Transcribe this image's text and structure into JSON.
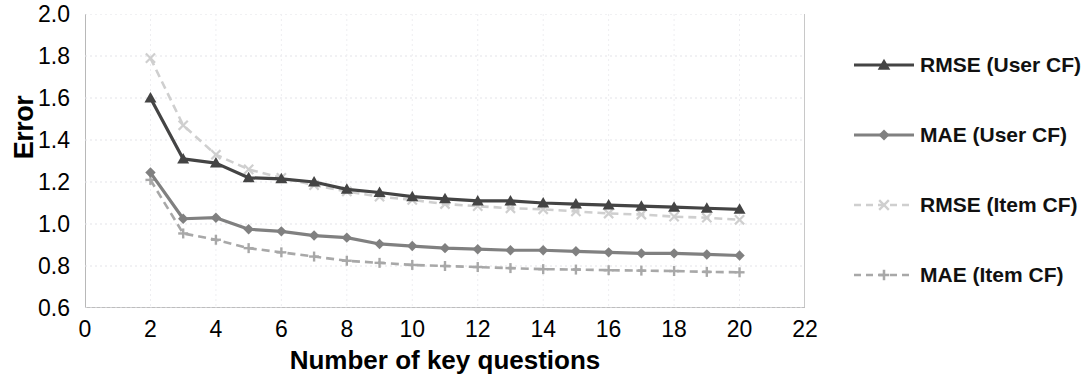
{
  "chart_data": {
    "type": "line",
    "title": "",
    "xlabel": "Number of key questions",
    "ylabel": "Error",
    "xlim": [
      0,
      22
    ],
    "ylim": [
      0.6,
      2.0
    ],
    "xticks": [
      "0",
      "2",
      "4",
      "6",
      "8",
      "10",
      "12",
      "14",
      "16",
      "18",
      "20",
      "22"
    ],
    "yticks": [
      "2.0",
      "1.8",
      "1.6",
      "1.4",
      "1.2",
      "1.0",
      "0.8",
      "0.6"
    ],
    "grid": true,
    "legend_position": "right",
    "x": [
      2,
      3,
      4,
      5,
      6,
      7,
      8,
      9,
      10,
      11,
      12,
      13,
      14,
      15,
      16,
      17,
      18,
      19,
      20
    ],
    "series": [
      {
        "name": "RMSE (User CF)",
        "color": "#444444",
        "style": "solid",
        "marker": "triangle",
        "values": [
          1.6,
          1.31,
          1.29,
          1.22,
          1.215,
          1.2,
          1.165,
          1.15,
          1.13,
          1.12,
          1.11,
          1.11,
          1.1,
          1.095,
          1.09,
          1.085,
          1.08,
          1.075,
          1.07
        ]
      },
      {
        "name": "MAE (User CF)",
        "color": "#808080",
        "style": "solid",
        "marker": "diamond",
        "values": [
          1.245,
          1.025,
          1.03,
          0.975,
          0.965,
          0.945,
          0.935,
          0.905,
          0.895,
          0.885,
          0.88,
          0.875,
          0.875,
          0.87,
          0.865,
          0.86,
          0.86,
          0.855,
          0.85
        ]
      },
      {
        "name": "RMSE (Item CF)",
        "color": "#cfcfcf",
        "style": "dashed",
        "marker": "x",
        "values": [
          1.79,
          1.47,
          1.33,
          1.26,
          1.22,
          1.185,
          1.155,
          1.13,
          1.115,
          1.095,
          1.085,
          1.075,
          1.07,
          1.06,
          1.05,
          1.045,
          1.035,
          1.03,
          1.02
        ]
      },
      {
        "name": "MAE (Item CF)",
        "color": "#a8a8a8",
        "style": "dashed",
        "marker": "plus",
        "values": [
          1.21,
          0.955,
          0.925,
          0.885,
          0.865,
          0.845,
          0.825,
          0.815,
          0.805,
          0.8,
          0.795,
          0.79,
          0.785,
          0.783,
          0.78,
          0.778,
          0.776,
          0.772,
          0.77
        ]
      }
    ]
  },
  "legend": {
    "items": [
      {
        "label": "RMSE (User CF)"
      },
      {
        "label": "MAE (User CF)"
      },
      {
        "label": "RMSE (Item CF)"
      },
      {
        "label": "MAE (Item CF)"
      }
    ]
  }
}
